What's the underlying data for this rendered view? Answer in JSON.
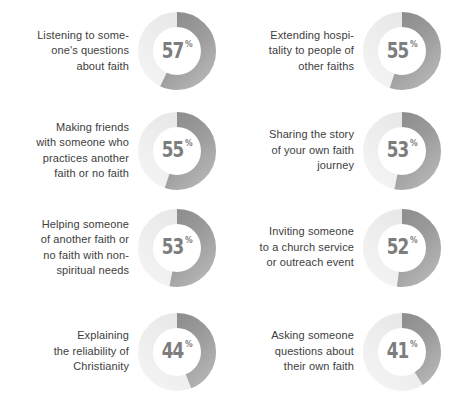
{
  "page": {
    "background_color": "#ffffff",
    "text_color": "#3d3d3d",
    "value_color": "#7d7d7d",
    "arc_color": "#8a8a8a",
    "track_color": "#ededed",
    "percent_sign": "%"
  },
  "chart_data": {
    "type": "pie",
    "title": "",
    "xlabel": "",
    "ylabel": "",
    "layout": "2-column x 4-row grid of donut charts",
    "legend": "none",
    "unit": "%",
    "categories": [
      "Listening to some-\none's questions\nabout faith",
      "Extending hospi-\ntality to people of\nother faiths",
      "Making friends\nwith someone who\npractices another\nfaith or no faith",
      "Sharing the story\nof your own faith\njourney",
      "Helping someone\nof another faith or\nno faith with non-\nspiritual needs",
      "Inviting someone\nto a church service\nor outreach event",
      "Explaining\nthe reliability of\nChristianity",
      "Asking someone\nquestions about\ntheir own faith"
    ],
    "values": [
      57,
      55,
      55,
      53,
      53,
      52,
      44,
      41
    ]
  },
  "items": [
    {
      "label": "Listening to some-\none's questions\nabout faith",
      "value": 57,
      "value_text": "57"
    },
    {
      "label": "Extending hospi-\ntality to people of\nother faiths",
      "value": 55,
      "value_text": "55"
    },
    {
      "label": "Making friends\nwith someone who\npractices another\nfaith or no faith",
      "value": 55,
      "value_text": "55"
    },
    {
      "label": "Sharing the story\nof your own faith\njourney",
      "value": 53,
      "value_text": "53"
    },
    {
      "label": "Helping someone\nof another faith or\nno faith with non-\nspiritual needs",
      "value": 53,
      "value_text": "53"
    },
    {
      "label": "Inviting someone\nto a church service\nor outreach event",
      "value": 52,
      "value_text": "52"
    },
    {
      "label": "Explaining\nthe reliability of\nChristianity",
      "value": 44,
      "value_text": "44"
    },
    {
      "label": "Asking someone\nquestions about\ntheir own faith",
      "value": 41,
      "value_text": "41"
    }
  ]
}
